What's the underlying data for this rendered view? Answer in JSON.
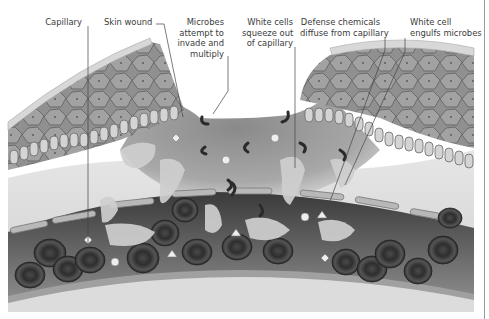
{
  "diagram": {
    "title": "",
    "style": "grayscale anatomical illustration",
    "labels": [
      {
        "id": "capillary",
        "lines": [
          "Capillary"
        ]
      },
      {
        "id": "skin-wound",
        "lines": [
          "Skin wound"
        ]
      },
      {
        "id": "microbes",
        "lines": [
          "Microbes",
          "attempt to",
          "invade and",
          "multiply"
        ]
      },
      {
        "id": "white-cells-squeeze",
        "lines": [
          "White cells",
          "squeeze out",
          "of capillary"
        ]
      },
      {
        "id": "defense-chemicals",
        "lines": [
          "Defense chemicals",
          "diffuse from capillary"
        ]
      },
      {
        "id": "white-cell-engulfs",
        "lines": [
          "White cell",
          "engulfs microbes"
        ]
      }
    ],
    "structures": [
      "epidermis cells",
      "basal cell layer",
      "dermis tissue",
      "capillary wall",
      "red blood cells",
      "white blood cells",
      "microbes",
      "defense chemicals"
    ],
    "colors": {
      "background": "#ffffff",
      "text": "#3a3a3a",
      "leader_line": "#444444",
      "skin_cells": "#8a8a8a",
      "dermis": "#d9d9d9",
      "wound_tissue": "#9a9a9a",
      "capillary_lumen": "#5a5a5a",
      "red_cell": "#3c3c3c",
      "white_cell": "#c8c8c8"
    }
  }
}
